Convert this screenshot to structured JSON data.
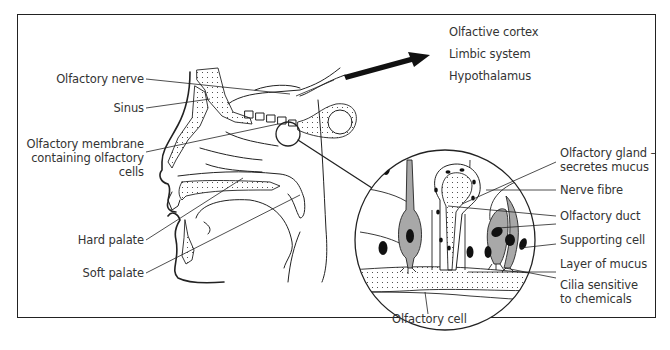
{
  "diagram": {
    "type": "anatomical-illustration",
    "left_labels": {
      "olfactory_nerve": "Olfactory nerve",
      "sinus": "Sinus",
      "olfactory_membrane_line1": "Olfactory membrane",
      "olfactory_membrane_line2": "containing olfactory",
      "olfactory_membrane_line3": "cells",
      "hard_palate": "Hard palate",
      "soft_palate": "Soft palate"
    },
    "arrow_targets": {
      "item1": "Olfactive cortex",
      "item2": "Limbic system",
      "item3": "Hypothalamus"
    },
    "detail_labels": {
      "gland_line1": "Olfactory gland –",
      "gland_line2": "secretes mucus",
      "nerve_fibre": "Nerve fibre",
      "duct": "Olfactory duct",
      "supporting_cell": "Supporting cell",
      "mucus_layer": "Layer of mucus",
      "cilia_line1": "Cilia sensitive",
      "cilia_line2": "to chemicals",
      "olfactory_cell": "Olfactory cell"
    },
    "colors": {
      "line": "#222222",
      "cell_fill": "#a8a8a8",
      "nucleus": "#111111",
      "text": "#333333"
    }
  }
}
